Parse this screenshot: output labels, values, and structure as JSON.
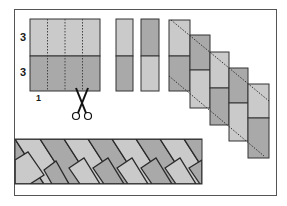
{
  "labels": {
    "top_height": "3",
    "bottom_height": "3",
    "strip_width": "1"
  },
  "colors": {
    "light": "#c9c9c9",
    "dark": "#a3a3a3",
    "outline": "#333333",
    "frame": "#555555",
    "background": "#ffffff"
  },
  "steps": [
    {
      "name": "two-strip-square",
      "description": "Square made of two 3-unit strips, marked in 1-unit columns with dotted lines"
    },
    {
      "name": "cut-strips",
      "description": "Cut into 1-unit segments with scissors"
    },
    {
      "name": "staircase",
      "description": "Segments offset in a staircase, diagonal dotted cut lines"
    },
    {
      "name": "herringbone-border",
      "description": "Resulting pieced diagonal border strip"
    }
  ]
}
